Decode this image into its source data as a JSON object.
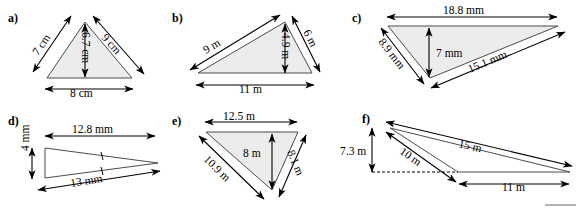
{
  "sheet": {
    "title": "Triangle dimension figures",
    "background_color": "#ffffff",
    "fill_color": "#ececec",
    "stroke_color": "#4c4c4c",
    "dimension_color": "#000000"
  },
  "figures": [
    {
      "key": "a",
      "part_label": "a)",
      "unit": "cm",
      "filled": true,
      "labels": {
        "left_side": "7 cm",
        "right_side": "9 cm",
        "height": "6.7 cm",
        "base": "8 cm"
      }
    },
    {
      "key": "b",
      "part_label": "b)",
      "unit": "m",
      "filled": true,
      "labels": {
        "left_side": "9 m",
        "right_side": "6 m",
        "height": "4.9 m",
        "base": "11 m"
      }
    },
    {
      "key": "c",
      "part_label": "c)",
      "unit": "mm",
      "filled": true,
      "labels": {
        "top_side": "18.8 mm",
        "left_side": "8.9 mm",
        "height": "7 mm",
        "bottom_side": "15.1 mm"
      }
    },
    {
      "key": "d",
      "part_label": "d)",
      "unit": "mm",
      "filled": false,
      "tick_marks": 2,
      "labels": {
        "top_side": "12.8 mm",
        "left_side": "4 mm",
        "bottom_side": "13 mm"
      }
    },
    {
      "key": "e",
      "part_label": "e)",
      "unit": "m",
      "filled": true,
      "labels": {
        "top_side": "12.5 m",
        "height": "8 m",
        "left_side": "10.9 m",
        "right_side": "8.1 m"
      }
    },
    {
      "key": "f",
      "part_label": "f)",
      "unit": "m",
      "filled": false,
      "labels": {
        "long_side": "15 m",
        "left_side": "10 m",
        "height": "7.3 m",
        "base": "11 m"
      }
    }
  ]
}
